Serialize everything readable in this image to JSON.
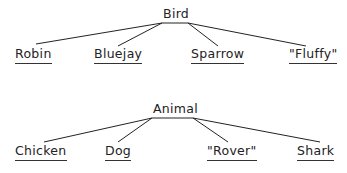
{
  "trees": [
    {
      "root": "Bird",
      "children": [
        {
          "label": "Robin",
          "underlined": true
        },
        {
          "label": "Bluejay",
          "underlined": true
        },
        {
          "label": "Sparrow",
          "underlined": true
        },
        {
          "label": "\"Fluffy\"",
          "underlined": true
        }
      ]
    },
    {
      "root": "Animal",
      "children": [
        {
          "label": "Chicken",
          "underlined": true
        },
        {
          "label": "Dog",
          "underlined": true
        },
        {
          "label": "\"Rover\"",
          "underlined": true
        },
        {
          "label": "Shark",
          "underlined": true
        }
      ]
    }
  ],
  "colors": {
    "line": "#222222",
    "text": "#222222",
    "background": "#ffffff"
  }
}
